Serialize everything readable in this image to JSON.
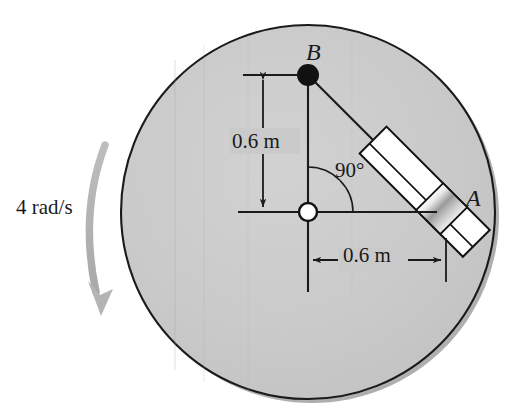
{
  "figure": {
    "type": "engineering-mechanics-diagram",
    "background_color": "#ffffff"
  },
  "disk": {
    "name": "rotating-disk",
    "center_x": 308,
    "center_y": 212,
    "radius": 187,
    "fill_color": "#c9c9c9",
    "stroke_color": "#1a1a1a",
    "shadow_color": "#6e6e6e"
  },
  "points": {
    "pivot": {
      "label": "O",
      "x": 308,
      "y": 212,
      "style": "open-circle",
      "fill": "#ffffff",
      "stroke": "#111111"
    },
    "b": {
      "label": "B",
      "x": 308,
      "y": 75,
      "style": "filled-circle",
      "fill": "#111111"
    },
    "a": {
      "label": "A",
      "x": 446,
      "y": 213,
      "style": "collar"
    }
  },
  "labels": {
    "point_b": "B",
    "point_a": "A",
    "angle": "90°",
    "dimension_vertical": "0.6 m",
    "dimension_horizontal": "0.6 m",
    "angular_velocity": "4 rad/s"
  },
  "dimensions": [
    {
      "name": "vertical-dimension",
      "value": "0.6 m",
      "quantity": 0.6,
      "unit": "m",
      "orientation": "vertical",
      "from": "O",
      "to": "B"
    },
    {
      "name": "horizontal-dimension",
      "value": "0.6 m",
      "quantity": 0.6,
      "unit": "m",
      "orientation": "horizontal",
      "from": "O",
      "to": "A"
    }
  ],
  "angle": {
    "name": "right-angle-arc",
    "value": "90°",
    "degrees": 90,
    "vertex": "O",
    "between": [
      "OB",
      "OA"
    ]
  },
  "rotation": {
    "name": "angular-velocity-arrow",
    "value": "4 rad/s",
    "magnitude": 4,
    "unit": "rad/s",
    "direction": "clockwise",
    "arrow_color": "#b4b4b4"
  },
  "rod": {
    "name": "slotted-guide-rod",
    "angle_deg": 45,
    "tube_fill": "#ffffff",
    "tube_stroke": "#111111",
    "collar_fill_light": "#f2f2f2",
    "collar_fill_dark": "#8e8e8e"
  },
  "colors": {
    "disk_gray": "#c9c9c9",
    "line_black": "#1a1a1a",
    "arrow_gray": "#b4b4b4",
    "white": "#ffffff"
  }
}
